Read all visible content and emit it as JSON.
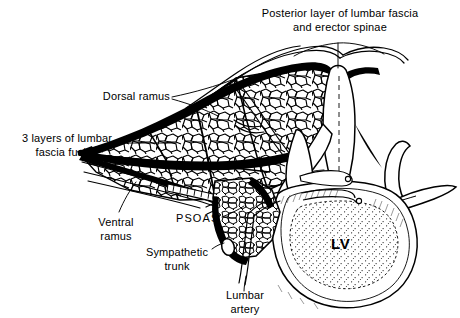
{
  "figure": {
    "background_color": "#ffffff",
    "ink_color": "#000000",
    "width": 460,
    "height": 318
  },
  "labels": {
    "posterior_fascia": {
      "line1": "Posterior layer of lumbar fascia",
      "line2": "and erector spinae"
    },
    "dorsal_ramus": "Dorsal ramus",
    "fascia_fusing": {
      "line1": "3 layers of lumbar",
      "line2": "fascia fusing"
    },
    "ventral_ramus": {
      "line1": "Ventral",
      "line2": "ramus"
    },
    "psoas": "PSOAS",
    "sympathetic_trunk": {
      "line1": "Sympathetic",
      "line2": "trunk"
    },
    "lumbar_artery": {
      "line1": "Lumbar",
      "line2": "artery"
    },
    "vertebral_body": "LV"
  },
  "structures": [
    {
      "name": "posterior-lumbar-fascia",
      "style": "thick-black-band"
    },
    {
      "name": "erector-spinae-muscle",
      "style": "fascicular-cellular-texture"
    },
    {
      "name": "spinous-process",
      "style": "outline"
    },
    {
      "name": "articular-process",
      "style": "outline"
    },
    {
      "name": "transverse-process",
      "style": "outline"
    },
    {
      "name": "vertebral-body",
      "style": "stippled-cancellous-bone"
    },
    {
      "name": "psoas-muscle",
      "style": "fascicular-cellular-texture"
    },
    {
      "name": "sympathetic-trunk",
      "style": "small-oval"
    },
    {
      "name": "lumbar-artery",
      "style": "thin-tube"
    },
    {
      "name": "dorsal-ramus-nerve",
      "style": "thin-tube"
    },
    {
      "name": "ventral-ramus-nerve",
      "style": "thin-tube"
    },
    {
      "name": "skin-and-subcutaneous-layer",
      "style": "thin-parallel-lines"
    }
  ]
}
